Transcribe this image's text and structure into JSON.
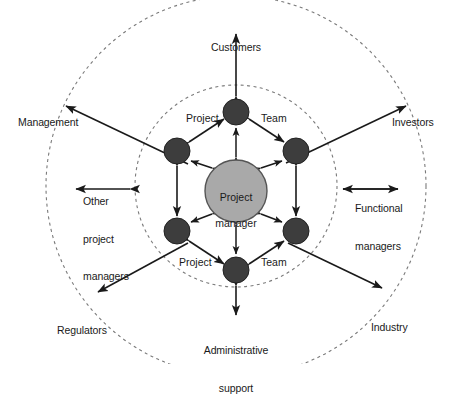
{
  "diagram": {
    "type": "concentric-radial-network",
    "colors": {
      "background": "#ffffff",
      "core_fill": "#a9a9a9",
      "core_stroke": "#555555",
      "node_fill": "#3d3d3d",
      "node_stroke": "#222222",
      "arrow": "#1a1a1a",
      "dashed_ring": "#7a7a7a",
      "text": "#1a1a1a"
    },
    "core": {
      "label": "Project\nmanager",
      "line1": "Project",
      "line2": "manager",
      "cx": 236,
      "cy": 191,
      "r": 31
    },
    "rings": [
      {
        "name": "inner-dashed-ring",
        "cx": 236,
        "cy": 186,
        "r": 101
      },
      {
        "name": "outer-dashed-ring",
        "cx": 236,
        "cy": 186,
        "r": 190
      }
    ],
    "inner_nodes": [
      {
        "name": "node-top",
        "label": "",
        "cx": 236,
        "cy": 112,
        "r": 13
      },
      {
        "name": "node-upper-left",
        "label": "",
        "cx": 177,
        "cy": 151,
        "r": 13
      },
      {
        "name": "node-upper-right",
        "label": "",
        "cx": 296,
        "cy": 151,
        "r": 13
      },
      {
        "name": "node-lower-left",
        "label": "",
        "cx": 177,
        "cy": 231,
        "r": 13
      },
      {
        "name": "node-lower-right",
        "label": "",
        "cx": 296,
        "cy": 231,
        "r": 13
      },
      {
        "name": "node-bottom",
        "label": "",
        "cx": 236,
        "cy": 270,
        "r": 13
      }
    ],
    "inner_labels": [
      {
        "name": "label-project-top",
        "text": "Project",
        "x": 186,
        "y": 112
      },
      {
        "name": "label-team-top",
        "text": "Team",
        "x": 261,
        "y": 112
      },
      {
        "name": "label-project-bottom",
        "text": "Project",
        "x": 179,
        "y": 256
      },
      {
        "name": "label-team-bottom",
        "text": "Team",
        "x": 261,
        "y": 256
      }
    ],
    "middle_stakeholders": [
      {
        "name": "stakeholder-other-project-managers",
        "lines": [
          "Other",
          "project",
          "managers"
        ],
        "x": 83,
        "y": 170
      },
      {
        "name": "stakeholder-functional-managers",
        "lines": [
          "Functional",
          "managers"
        ],
        "x": 355,
        "y": 177
      }
    ],
    "outer_stakeholders": [
      {
        "name": "stakeholder-customers",
        "lines": [
          "Customers"
        ],
        "x": 236,
        "y": 16,
        "align": "center"
      },
      {
        "name": "stakeholder-management",
        "lines": [
          "Management"
        ],
        "x": 18,
        "y": 91,
        "align": "left"
      },
      {
        "name": "stakeholder-investors",
        "lines": [
          "Investors"
        ],
        "x": 392,
        "y": 91,
        "align": "left"
      },
      {
        "name": "stakeholder-regulators",
        "lines": [
          "Regulators"
        ],
        "x": 57,
        "y": 299,
        "align": "left"
      },
      {
        "name": "stakeholder-industry",
        "lines": [
          "Industry"
        ],
        "x": 371,
        "y": 296,
        "align": "left"
      },
      {
        "name": "stakeholder-administrative-support",
        "lines": [
          "Administrative",
          "support"
        ],
        "x": 236,
        "y": 319,
        "align": "center"
      }
    ]
  }
}
